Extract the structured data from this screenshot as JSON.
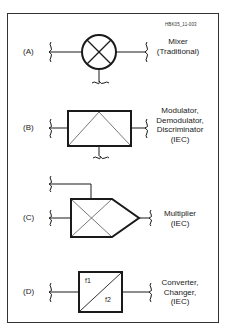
{
  "figure_id": "HBK05_11-003",
  "symbols": [
    {
      "tag": "(A)",
      "name_lines": [
        "Mixer",
        "(Traditional)"
      ]
    },
    {
      "tag": "(B)",
      "name_lines": [
        "Modulator,",
        "Demodulator,",
        "Discriminator",
        "(IEC)"
      ]
    },
    {
      "tag": "(C)",
      "name_lines": [
        "Multiplier",
        "(IEC)"
      ]
    },
    {
      "tag": "(D)",
      "name_lines": [
        "Converter,",
        "Changer,",
        "(IEC)"
      ],
      "inner_labels": [
        "f1",
        "f2"
      ]
    }
  ],
  "colors": {
    "line": "#1a1a1a",
    "thin_line": "#555555",
    "border": "#333333",
    "background": "#ffffff"
  }
}
